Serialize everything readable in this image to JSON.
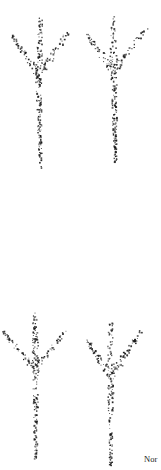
{
  "figure": {
    "ink_color": "#1a1a1a",
    "caption_text": "Nor",
    "footprints": [
      {
        "id": "top-left",
        "center_top": [
          40,
          17
        ],
        "left_tip": [
          11,
          34
        ],
        "right_tip": [
          67,
          32
        ],
        "junction": [
          38,
          75
        ],
        "heel": [
          40,
          168
        ],
        "dot_count": 260
      },
      {
        "id": "top-right",
        "center_top": [
          112,
          14
        ],
        "left_tip": [
          85,
          33
        ],
        "right_tip": [
          147,
          26
        ],
        "junction": [
          113,
          70
        ],
        "heel": [
          115,
          162
        ],
        "dot_count": 260
      },
      {
        "id": "bottom-left",
        "center_top": [
          34,
          313
        ],
        "left_tip": [
          2,
          331
        ],
        "right_tip": [
          64,
          331
        ],
        "junction": [
          35,
          368
        ],
        "heel": [
          35,
          462
        ],
        "dot_count": 250
      },
      {
        "id": "bottom-right",
        "center_top": [
          110,
          315
        ],
        "left_tip": [
          86,
          339
        ],
        "right_tip": [
          141,
          330
        ],
        "junction": [
          110,
          376
        ],
        "heel": [
          110,
          466
        ],
        "dot_count": 250
      }
    ]
  }
}
